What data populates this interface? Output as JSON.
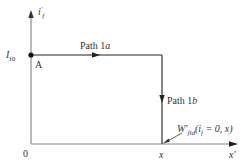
{
  "diagram": {
    "type": "energy-path",
    "axes": {
      "y_label_main": "i",
      "y_label_sub": "f",
      "y_label_prime": "′",
      "x_label": "x′",
      "origin_label": "0",
      "x_tick_label": "x"
    },
    "points": {
      "start": {
        "label": "A",
        "value_label_main": "I",
        "value_label_sub": "f0"
      }
    },
    "paths": [
      {
        "id": "path-1a",
        "label_prefix": "Path 1",
        "label_suffix": "a",
        "direction": "right"
      },
      {
        "id": "path-1b",
        "label_prefix": "Path 1",
        "label_suffix": "b",
        "direction": "down"
      }
    ],
    "annotation": {
      "main": "W′",
      "sub": "fld",
      "args_open": "(i",
      "args_sub": "f",
      "args_close": " = 0, x)"
    },
    "colors": {
      "axis": "#8a8a8a",
      "path": "#222222",
      "text": "#333333"
    }
  }
}
